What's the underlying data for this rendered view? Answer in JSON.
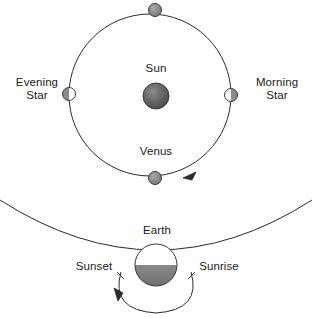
{
  "diagram": {
    "colors": {
      "stroke": "#2b2b2b",
      "text": "#1a1a1a",
      "background": "#ffffff",
      "sun_fill": "#555555",
      "sun_highlight": "#8f8f8f",
      "venus_dark": "#8a8a8a",
      "venus_lit": "#ffffff",
      "earth_lit": "#ffffff",
      "earth_dark": "#8a8a8a"
    }
  },
  "orbit_diagram": {
    "center_label": "Sun",
    "orbit_label": "Venus",
    "left_label": "Evening\nStar",
    "right_label": "Morning\nStar",
    "direction_arrow": "clockwise-orbit-arrow",
    "sun": {
      "cx": 156,
      "cy": 96,
      "r": 13
    },
    "orbit": {
      "cx": 150,
      "cy": 95,
      "r": 81
    },
    "venus_positions": [
      {
        "name": "venus-superior-conjunction",
        "cx": 155,
        "cy": 10,
        "r": 6.5,
        "phase": "dark"
      },
      {
        "name": "venus-morning-star",
        "cx": 231,
        "cy": 95,
        "r": 6.5,
        "phase": "lit-left"
      },
      {
        "name": "venus-inferior-conjunction",
        "cx": 155,
        "cy": 178,
        "r": 6.5,
        "phase": "dark"
      },
      {
        "name": "venus-evening-star",
        "cx": 69,
        "cy": 94,
        "r": 6.5,
        "phase": "lit-right"
      }
    ]
  },
  "earth_diagram": {
    "earth_label": "Earth",
    "left_label": "Sunset",
    "right_label": "Sunrise",
    "direction_arrow": "counterclockwise-rotation-arrow",
    "earth": {
      "cx": 156,
      "cy": 265,
      "r": 21
    },
    "horizon": {
      "from_x": 0,
      "from_y": 200,
      "to_x": 312,
      "to_y": 200
    }
  }
}
